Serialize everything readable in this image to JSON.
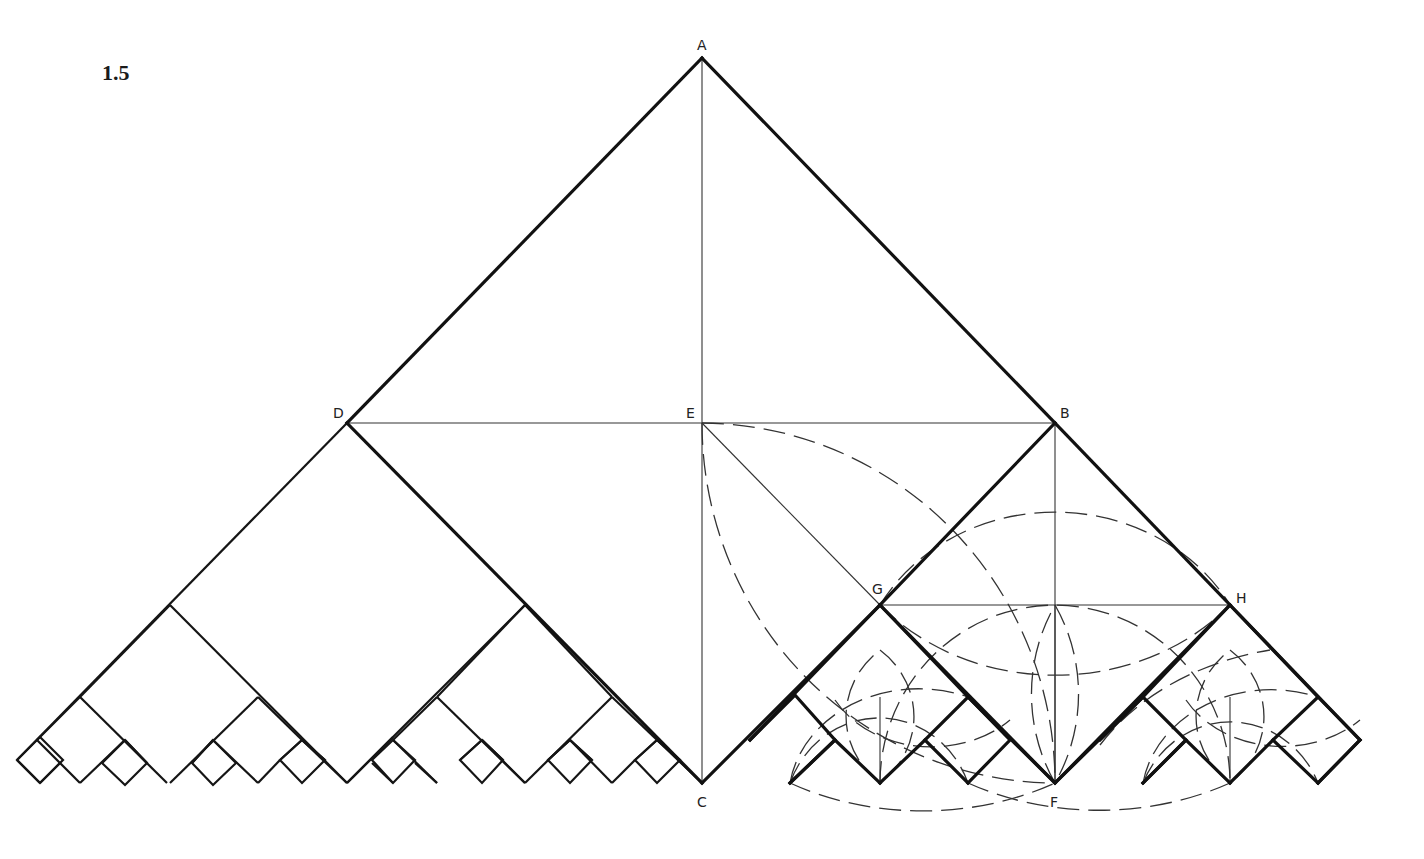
{
  "figure": {
    "number": "1.5",
    "width": 1424,
    "height": 859
  },
  "points": {
    "A": {
      "label": "A",
      "x": 702,
      "y": 58,
      "lx": 697,
      "ly": 50
    },
    "B": {
      "label": "B",
      "x": 1055,
      "y": 423,
      "lx": 1060,
      "ly": 418
    },
    "C": {
      "label": "C",
      "x": 702,
      "y": 783,
      "lx": 697,
      "ly": 807
    },
    "D": {
      "label": "D",
      "x": 347,
      "y": 423,
      "lx": 333,
      "ly": 418
    },
    "E": {
      "label": "E",
      "x": 702,
      "y": 423,
      "lx": 686,
      "ly": 418
    },
    "F": {
      "label": "F",
      "x": 1055,
      "y": 783,
      "lx": 1050,
      "ly": 807
    },
    "G": {
      "label": "G",
      "x": 880,
      "y": 605,
      "lx": 872,
      "ly": 594
    },
    "H": {
      "label": "H",
      "x": 1230,
      "y": 605,
      "lx": 1236,
      "ly": 603
    }
  },
  "thick_lines": [
    [
      702,
      58,
      347,
      423
    ],
    [
      702,
      58,
      1055,
      423
    ],
    [
      347,
      423,
      702,
      783
    ],
    [
      1055,
      423,
      880,
      605
    ],
    [
      880,
      605,
      1055,
      783
    ],
    [
      1055,
      783,
      1230,
      605
    ],
    [
      1230,
      605,
      1055,
      423
    ],
    [
      880,
      605,
      702,
      783
    ],
    [
      1230,
      605,
      1360,
      740
    ],
    [
      1360,
      740,
      1318,
      783
    ]
  ],
  "medium_lines": [
    [
      347,
      423,
      17,
      760
    ],
    [
      17,
      760,
      40,
      783
    ],
    [
      170,
      605,
      347,
      783
    ],
    [
      170,
      605,
      80,
      697
    ],
    [
      80,
      697,
      167,
      783
    ],
    [
      258,
      697,
      170,
      783
    ],
    [
      258,
      697,
      302,
      740
    ],
    [
      80,
      697,
      37,
      740
    ],
    [
      37,
      740,
      80,
      783
    ],
    [
      40,
      783,
      60,
      763
    ],
    [
      125,
      740,
      80,
      783
    ],
    [
      125,
      740,
      147,
      763
    ],
    [
      125,
      740,
      102,
      763
    ],
    [
      213,
      740,
      258,
      783
    ],
    [
      213,
      740,
      192,
      763
    ],
    [
      258,
      783,
      280,
      760
    ],
    [
      302,
      740,
      280,
      760
    ],
    [
      302,
      740,
      325,
      760
    ],
    [
      302,
      740,
      347,
      783
    ],
    [
      347,
      783,
      393,
      737
    ],
    [
      525,
      605,
      347,
      783
    ],
    [
      525,
      605,
      612,
      697
    ],
    [
      525,
      605,
      437,
      697
    ],
    [
      437,
      697,
      525,
      783
    ],
    [
      612,
      697,
      525,
      783
    ],
    [
      437,
      697,
      393,
      740
    ],
    [
      393,
      740,
      437,
      783
    ],
    [
      372,
      763,
      393,
      783
    ],
    [
      415,
      763,
      437,
      783
    ],
    [
      482,
      740,
      525,
      783
    ],
    [
      482,
      740,
      460,
      760
    ],
    [
      482,
      740,
      503,
      760
    ],
    [
      612,
      697,
      657,
      740
    ],
    [
      657,
      740,
      702,
      783
    ],
    [
      570,
      740,
      612,
      783
    ],
    [
      570,
      740,
      548,
      760
    ],
    [
      570,
      740,
      592,
      760
    ],
    [
      612,
      783,
      635,
      760
    ],
    [
      657,
      740,
      635,
      760
    ],
    [
      657,
      740,
      680,
      760
    ]
  ],
  "small_squares": [
    [
      17,
      760,
      40,
      737,
      63,
      760,
      40,
      783
    ],
    [
      102,
      763,
      125,
      740,
      147,
      763,
      125,
      785
    ],
    [
      192,
      763,
      213,
      740,
      236,
      763,
      213,
      785
    ],
    [
      280,
      760,
      302,
      740,
      325,
      760,
      302,
      783
    ],
    [
      372,
      760,
      393,
      740,
      415,
      760,
      393,
      783
    ],
    [
      460,
      760,
      482,
      740,
      503,
      760,
      482,
      783
    ],
    [
      548,
      760,
      570,
      740,
      592,
      760,
      570,
      783
    ],
    [
      635,
      760,
      657,
      740,
      680,
      760,
      657,
      783
    ]
  ],
  "right_squares": [
    [
      750,
      740,
      795,
      695,
      835,
      740,
      790,
      783
    ],
    [
      790,
      783,
      835,
      740,
      880,
      783
    ],
    [
      880,
      783,
      925,
      740,
      968,
      783
    ],
    [
      925,
      740,
      968,
      697,
      1010,
      740,
      968,
      783
    ],
    [
      1100,
      740,
      1143,
      697,
      1186,
      740,
      1143,
      783
    ],
    [
      1143,
      783,
      1186,
      740,
      1230,
      783
    ],
    [
      1230,
      783,
      1273,
      740,
      1318,
      783
    ],
    [
      1273,
      740,
      1318,
      697,
      1360,
      740,
      1318,
      783
    ]
  ],
  "right_zigzag": [
    750,
    740,
    880,
    605,
    968,
    697,
    1055,
    783,
    1143,
    697,
    1230,
    605,
    1318,
    697
  ],
  "thin_lines": [
    [
      702,
      58,
      702,
      783
    ],
    [
      347,
      423,
      1055,
      423
    ],
    [
      1055,
      423,
      1055,
      783
    ],
    [
      702,
      423,
      880,
      605
    ],
    [
      880,
      605,
      1230,
      605
    ],
    [
      1055,
      605,
      1055,
      783
    ],
    [
      880,
      697,
      880,
      783
    ],
    [
      1230,
      697,
      1230,
      783
    ]
  ],
  "dashed_arcs": [
    "M 702 423 A 355 360 0 0 1 1055 783",
    "M 702 423 A 355 360 0 0 0 1055 783",
    "M 880 605 A 200 180 0 0 1 1230 605",
    "M 880 605 A 230 200 0 0 0 1230 605",
    "M 880 783 A 175 178 0 0 1 1230 783",
    "M 790 783 A 95 100 0 0 1 968 783",
    "M 790 783 A 130 110 0 0 1 968 697",
    "M 835 700 A 110 90 0 0 0 1010 720",
    "M 880 783 A 90 85 0 0 1 880 650",
    "M 880 650 A 90 85 0 0 1 880 783",
    "M 790 783 A 260 200 0 0 0 1055 783",
    "M 968 783 A 260 200 0 0 0 1230 783",
    "M 1143 783 A 95 100 0 0 1 1318 783",
    "M 1143 783 A 130 110 0 0 1 1318 697",
    "M 1186 700 A 110 90 0 0 0 1360 720",
    "M 1230 783 A 90 85 0 0 1 1230 650",
    "M 1230 650 A 90 85 0 0 1 1230 783",
    "M 1055 783 A 180 180 0 0 1 1055 605",
    "M 1055 605 A 180 180 0 0 1 1055 783",
    "M 1100 745 A 260 200 0 0 1 1270 650"
  ]
}
